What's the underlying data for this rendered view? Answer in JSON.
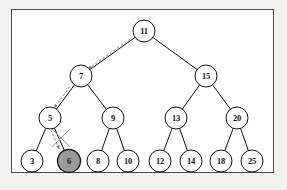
{
  "figure": {
    "panel_background": "#ffffff",
    "outer_background": "#f2f2f0",
    "border_color": "#4a4a4a"
  },
  "style": {
    "node_stroke": "#111111",
    "node_fill": "#ffffff",
    "shaded_node_fill": "#9a9a9a",
    "edge_color": "#111111",
    "search_path_color": "#777777",
    "cross_mark_color": "#888888",
    "node_radius": 11,
    "shaded_node_radius": 11.5
  },
  "tree": {
    "nodes": [
      {
        "id": "n11",
        "label": "11",
        "x": 144,
        "y": 31,
        "shaded": false
      },
      {
        "id": "n7",
        "label": "7",
        "x": 81,
        "y": 76,
        "shaded": false
      },
      {
        "id": "n15",
        "label": "15",
        "x": 206,
        "y": 76,
        "shaded": false
      },
      {
        "id": "n5",
        "label": "5",
        "x": 50,
        "y": 118,
        "shaded": false
      },
      {
        "id": "n9",
        "label": "9",
        "x": 113,
        "y": 118,
        "shaded": false
      },
      {
        "id": "n13",
        "label": "13",
        "x": 176,
        "y": 118,
        "shaded": false
      },
      {
        "id": "n20",
        "label": "20",
        "x": 237,
        "y": 118,
        "shaded": false
      },
      {
        "id": "n3",
        "label": "3",
        "x": 32,
        "y": 161,
        "shaded": false
      },
      {
        "id": "n6",
        "label": "6",
        "x": 69,
        "y": 161,
        "shaded": true
      },
      {
        "id": "n8",
        "label": "8",
        "x": 98,
        "y": 161,
        "shaded": false
      },
      {
        "id": "n10",
        "label": "10",
        "x": 128,
        "y": 161,
        "shaded": false
      },
      {
        "id": "n12",
        "label": "12",
        "x": 160,
        "y": 161,
        "shaded": false
      },
      {
        "id": "n14",
        "label": "14",
        "x": 191,
        "y": 161,
        "shaded": false
      },
      {
        "id": "n18",
        "label": "18",
        "x": 221,
        "y": 161,
        "shaded": false
      },
      {
        "id": "n25",
        "label": "25",
        "x": 252,
        "y": 161,
        "shaded": false
      }
    ],
    "edges": [
      {
        "from": "n11",
        "to": "n7"
      },
      {
        "from": "n11",
        "to": "n15"
      },
      {
        "from": "n7",
        "to": "n5"
      },
      {
        "from": "n7",
        "to": "n9"
      },
      {
        "from": "n15",
        "to": "n13"
      },
      {
        "from": "n15",
        "to": "n20"
      },
      {
        "from": "n5",
        "to": "n3"
      },
      {
        "from": "n5",
        "to": "n6"
      },
      {
        "from": "n9",
        "to": "n8"
      },
      {
        "from": "n9",
        "to": "n10"
      },
      {
        "from": "n13",
        "to": "n12"
      },
      {
        "from": "n13",
        "to": "n14"
      },
      {
        "from": "n20",
        "to": "n18"
      },
      {
        "from": "n20",
        "to": "n25"
      }
    ],
    "search_path": [
      {
        "from": "n11",
        "to": "n7"
      },
      {
        "from": "n7",
        "to": "n5"
      },
      {
        "from": "n5",
        "to": "n6"
      }
    ],
    "deleted_node": "n6",
    "cut_marks": [
      {
        "name": "edge-cut-mark",
        "x": 61,
        "y": 138
      },
      {
        "name": "node-cut-mark",
        "x": 69,
        "y": 161
      }
    ]
  }
}
